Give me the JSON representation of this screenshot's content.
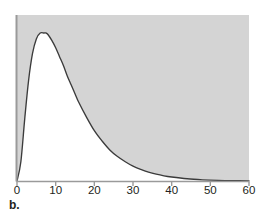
{
  "figure": {
    "caption": "b.",
    "panel_label": "b."
  },
  "colors": {
    "shaded_region": "#d4d4d4",
    "plot_background": "#ffffff",
    "curve": "#3b3b3b",
    "axis": "#9a9a9a",
    "tick": "#9a9a9a",
    "label_text": "#231f20"
  },
  "chart_data": {
    "type": "area",
    "title": "",
    "subtitle": "",
    "xlabel": "",
    "ylabel": "",
    "xlim": [
      0,
      60
    ],
    "ylim": [
      0,
      1
    ],
    "grid": false,
    "legend": false,
    "legend_position": "none",
    "annotations": [
      "b."
    ],
    "x_ticks": [
      0,
      10,
      20,
      30,
      40,
      50,
      60
    ],
    "x_tick_labels": [
      "0",
      "10",
      "20",
      "30",
      "40",
      "50",
      "60"
    ],
    "y_ticks": [],
    "y_tick_labels": [],
    "shading": "above-curve",
    "peak_x": 7.5,
    "peak_y": 1.0,
    "x": [
      0,
      1,
      2,
      3,
      4,
      5,
      6,
      7,
      7.5,
      8,
      9,
      10,
      11,
      12,
      13,
      14,
      15,
      16,
      18,
      20,
      22,
      24,
      26,
      28,
      30,
      32,
      34,
      36,
      38,
      40,
      44,
      48,
      52,
      56,
      60
    ],
    "y": [
      0.0,
      0.13,
      0.42,
      0.68,
      0.86,
      0.96,
      1.0,
      1.0,
      1.0,
      0.99,
      0.95,
      0.9,
      0.84,
      0.78,
      0.71,
      0.65,
      0.59,
      0.53,
      0.43,
      0.34,
      0.27,
      0.21,
      0.165,
      0.13,
      0.1,
      0.078,
      0.06,
      0.046,
      0.035,
      0.027,
      0.015,
      0.008,
      0.004,
      0.002,
      0.001
    ],
    "series": [
      {
        "name": "density",
        "x": [
          0,
          1,
          2,
          3,
          4,
          5,
          6,
          7,
          7.5,
          8,
          9,
          10,
          11,
          12,
          13,
          14,
          15,
          16,
          18,
          20,
          22,
          24,
          26,
          28,
          30,
          32,
          34,
          36,
          38,
          40,
          44,
          48,
          52,
          56,
          60
        ],
        "values": [
          0.0,
          0.13,
          0.42,
          0.68,
          0.86,
          0.96,
          1.0,
          1.0,
          1.0,
          0.99,
          0.95,
          0.9,
          0.84,
          0.78,
          0.71,
          0.65,
          0.59,
          0.53,
          0.43,
          0.34,
          0.27,
          0.21,
          0.165,
          0.13,
          0.1,
          0.078,
          0.06,
          0.046,
          0.035,
          0.027,
          0.015,
          0.008,
          0.004,
          0.002,
          0.001
        ]
      }
    ]
  }
}
